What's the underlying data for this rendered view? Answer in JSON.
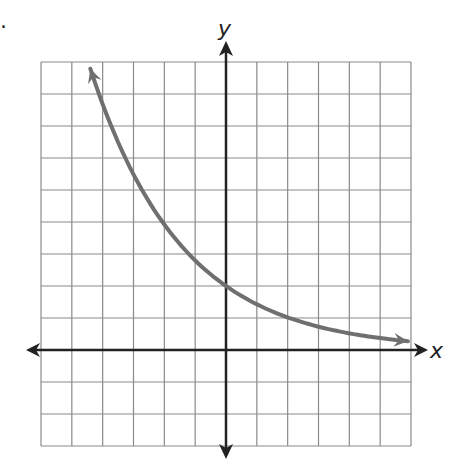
{
  "figure": {
    "marker_dot": "."
  },
  "colors": {
    "grid": "#8a8a8a",
    "axes": "#222222",
    "curve": "#6f6f6f",
    "background": "#ffffff"
  },
  "chart_data": {
    "type": "line",
    "title": "",
    "xlabel": "x",
    "ylabel": "y",
    "xlim": [
      -6,
      6
    ],
    "ylim": [
      -3,
      9
    ],
    "grid": true,
    "grid_step": 1,
    "tick_labels": false,
    "axis_arrows": true,
    "curve_arrows": "both ends",
    "approx_equation": "y = 2(1.4)^(-x)",
    "series": [
      {
        "name": "curve",
        "x": [
          -4.4,
          -4,
          -3,
          -2,
          -1,
          0,
          1,
          2,
          3,
          4,
          5,
          5.9
        ],
        "y": [
          8.8,
          7.7,
          5.3,
          4.0,
          2.9,
          2.0,
          1.4,
          1.0,
          0.7,
          0.5,
          0.37,
          0.28
        ]
      }
    ]
  }
}
